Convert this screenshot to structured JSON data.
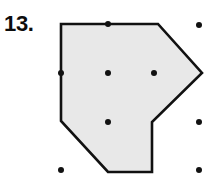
{
  "problem": {
    "number_label": "13."
  },
  "figure": {
    "kind": "geoboard-polygon",
    "canvas": {
      "width": 213,
      "height": 188
    },
    "colors": {
      "background": "#ffffff",
      "polygon_fill": "#e8e8e8",
      "polygon_stroke": "#111111",
      "dot_color": "#111111",
      "label_color": "#0d0d0d"
    },
    "polygon": {
      "stroke_width": 2.6,
      "vertex_count": 7,
      "points": [
        {
          "x": 61,
          "y": 24
        },
        {
          "x": 158,
          "y": 24
        },
        {
          "x": 202,
          "y": 73
        },
        {
          "x": 152,
          "y": 122
        },
        {
          "x": 152,
          "y": 172
        },
        {
          "x": 108,
          "y": 172
        },
        {
          "x": 61,
          "y": 121
        }
      ],
      "points_attr": "61,24 158,24 202,73 152,122 152,172 108,172 61,121"
    },
    "grid": {
      "columns_x": [
        61,
        108,
        154,
        199
      ],
      "rows_y": [
        25,
        73,
        122,
        170
      ],
      "dot_radius": 3.0,
      "dots": [
        {
          "x": 108,
          "y": 24
        },
        {
          "x": 199,
          "y": 25
        },
        {
          "x": 61,
          "y": 73
        },
        {
          "x": 108,
          "y": 73
        },
        {
          "x": 154,
          "y": 73
        },
        {
          "x": 108,
          "y": 122
        },
        {
          "x": 199,
          "y": 122
        },
        {
          "x": 61,
          "y": 170
        },
        {
          "x": 199,
          "y": 170
        }
      ]
    }
  }
}
